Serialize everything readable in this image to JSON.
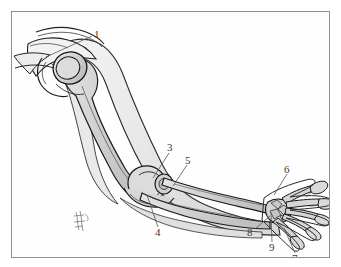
{
  "figure": {
    "frame": {
      "border_color": "#8e8e8e",
      "background_color": "#fefefe",
      "page_background": "#ffffff"
    },
    "style": {
      "ink_color": "#1d1d1d",
      "bone_fill": "#d8d8d8",
      "soft_tissue_fill": "#efefef",
      "shadow_fill": "#bdbdbd",
      "label_color": "#3b3b3b",
      "leader_color": "#555555"
    },
    "artist_mark": {
      "name": "artist-signature",
      "x": 68,
      "y": 208
    },
    "callouts": [
      {
        "id": "1",
        "label": "1",
        "x": 82,
        "y": 17,
        "target": "humeral-head",
        "leader": [
          [
            80,
            24
          ],
          [
            34,
            45
          ]
        ]
      },
      {
        "id": "3",
        "label": "3",
        "x": 155,
        "y": 130,
        "target": "lateral-epicondyle",
        "leader": [
          [
            157,
            141
          ],
          [
            141,
            166
          ]
        ]
      },
      {
        "id": "5",
        "label": "5",
        "x": 173,
        "y": 143,
        "target": "radial-head",
        "leader": [
          [
            175,
            153
          ],
          [
            161,
            174
          ]
        ]
      },
      {
        "id": "4",
        "label": "4",
        "x": 143,
        "y": 215,
        "target": "trochlea-medial-epicondyle",
        "leader": [
          [
            146,
            215
          ],
          [
            135,
            183
          ]
        ]
      },
      {
        "id": "6",
        "label": "6",
        "x": 272,
        "y": 152,
        "target": "metacarpals",
        "leader": [
          [
            275,
            162
          ],
          [
            262,
            183
          ]
        ]
      },
      {
        "id": "8",
        "label": "8",
        "x": 235,
        "y": 215,
        "target": "radius-distal-end",
        "leader": [
          [
            243,
            217
          ],
          [
            258,
            204
          ]
        ]
      },
      {
        "id": "9",
        "label": "9",
        "x": 257,
        "y": 230,
        "target": "carpals",
        "leader": [
          [
            260,
            230
          ],
          [
            259,
            201
          ]
        ]
      },
      {
        "id": "7",
        "label": "7",
        "x": 280,
        "y": 241,
        "target": "phalanges",
        "leader": [
          [
            283,
            241
          ],
          [
            272,
            216
          ]
        ]
      }
    ],
    "structures": [
      {
        "name": "scapula",
        "region": "shoulder"
      },
      {
        "name": "clavicle",
        "region": "shoulder"
      },
      {
        "name": "humerus",
        "region": "upper-arm"
      },
      {
        "name": "humeral-head",
        "region": "shoulder"
      },
      {
        "name": "elbow-joint",
        "region": "elbow"
      },
      {
        "name": "ulna",
        "region": "forearm"
      },
      {
        "name": "radius",
        "region": "forearm"
      },
      {
        "name": "carpals",
        "region": "wrist"
      },
      {
        "name": "metacarpals",
        "region": "hand"
      },
      {
        "name": "phalanges",
        "region": "hand"
      },
      {
        "name": "soft-tissue-outline",
        "region": "whole-limb"
      }
    ]
  }
}
